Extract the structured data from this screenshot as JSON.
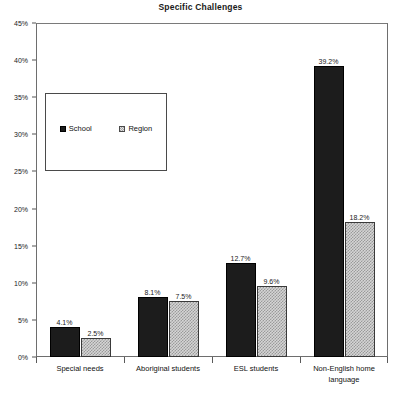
{
  "chart_data": {
    "type": "bar",
    "title": "Specific Challenges",
    "xlabel": "",
    "ylabel": "",
    "ylim": [
      0,
      45
    ],
    "ytick_step": 5,
    "ytick_labels": [
      "0%",
      "5%",
      "10%",
      "15%",
      "20%",
      "25%",
      "30%",
      "35%",
      "40%",
      "45%"
    ],
    "ytick_values": [
      0,
      5,
      10,
      15,
      20,
      25,
      30,
      35,
      40,
      45
    ],
    "grid": false,
    "legend_position": "upper-left-inset",
    "categories": [
      "Special needs",
      "Aboriginal students",
      "ESL students",
      "Non-English home language"
    ],
    "series": [
      {
        "name": "School",
        "values": [
          4.1,
          8.1,
          12.7,
          39.2
        ],
        "value_labels": [
          "4.1%",
          "8.1%",
          "12.7%",
          "39.2%"
        ],
        "color": "#1c1c1c",
        "pattern": "solid"
      },
      {
        "name": "Region",
        "values": [
          2.5,
          7.5,
          9.6,
          18.2
        ],
        "value_labels": [
          "2.5%",
          "7.5%",
          "9.6%",
          "18.2%"
        ],
        "color": "#d5d5d5",
        "pattern": "checkered"
      }
    ]
  },
  "legend": {
    "entries": [
      {
        "label": "School",
        "swatch": "solid-black-square-icon"
      },
      {
        "label": "Region",
        "swatch": "hatched-gray-square-icon"
      }
    ]
  }
}
